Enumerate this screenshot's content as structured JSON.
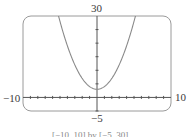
{
  "chart_data": {
    "type": "line",
    "title": "",
    "function": "y = x^2 + 3",
    "series": [
      {
        "name": "f(x)",
        "x": [
          -5.2,
          -4,
          -3,
          -2,
          -1,
          0,
          1,
          2,
          3,
          4,
          5.2
        ],
        "values": [
          30,
          19,
          12,
          7,
          4,
          3,
          4,
          7,
          12,
          19,
          30
        ]
      }
    ],
    "xlim": [
      -10,
      10
    ],
    "ylim": [
      -5,
      30
    ],
    "x_tick_step": 1,
    "y_tick_step": 5,
    "xlabel": "",
    "ylabel": "",
    "grid": false,
    "window_labels": {
      "xmin": "−10",
      "xmax": "10",
      "ymin": "−5",
      "ymax": "30"
    },
    "caption": "[−10, 10] by [−5, 30]"
  },
  "colors": {
    "curve": "#8a8a8a",
    "axes": "#555555",
    "frame": "#9a9a9a"
  }
}
